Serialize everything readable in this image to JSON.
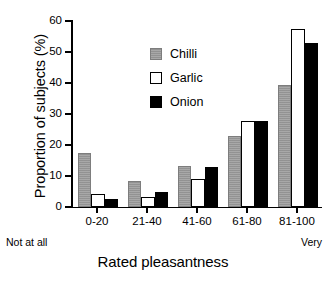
{
  "chart_data": {
    "type": "bar",
    "title": "",
    "xlabel": "Rated pleasantness",
    "ylabel": "Proportion of subjects (%)",
    "categories": [
      "0-20",
      "21-40",
      "41-60",
      "61-80",
      "81-100"
    ],
    "series": [
      {
        "name": "Chilli",
        "color": "#9a9a9a",
        "values": [
          17.5,
          8.5,
          13.3,
          23.0,
          39.3
        ]
      },
      {
        "name": "Garlic",
        "color": "#ffffff",
        "values": [
          4.3,
          3.2,
          9.0,
          27.8,
          57.5
        ]
      },
      {
        "name": "Onion",
        "color": "#000000",
        "values": [
          2.6,
          5.0,
          13.0,
          27.8,
          53.0
        ]
      }
    ],
    "ylim": [
      0,
      60
    ],
    "yticks": [
      0,
      10,
      20,
      30,
      40,
      50,
      60
    ],
    "yticklabels": [
      "0",
      "10",
      "20",
      "30",
      "40",
      "50",
      "60"
    ],
    "grid": false,
    "legend_position": "upper center",
    "axis_anchor_low": "Not at all",
    "axis_anchor_high": "Very"
  }
}
